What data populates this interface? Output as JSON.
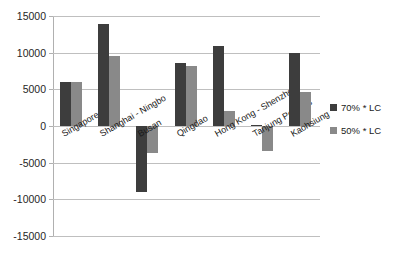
{
  "chart_data": {
    "type": "bar",
    "title": "",
    "subtitle": "",
    "xlabel": "",
    "ylabel": "",
    "ylim": [
      -15000,
      15000
    ],
    "ytick_values": [
      15000,
      10000,
      5000,
      0,
      -5000,
      -10000,
      -15000
    ],
    "ytick_labels": [
      "15000",
      "10000",
      "5000",
      "0",
      "-5000",
      "-10000",
      "-15000"
    ],
    "grid": true,
    "legend_position": "right",
    "categories": [
      "Singapore",
      "Shanghai - Ningbo",
      "Busan",
      "Qingdao",
      "Hong Kong - Shenzhen",
      "Tanjung Pelepas",
      "Kaohsiung"
    ],
    "series": [
      {
        "name": "70% * LC",
        "color": "#3d3d3d",
        "values": [
          6000,
          13900,
          -9000,
          8600,
          10900,
          100,
          9900
        ]
      },
      {
        "name": "50% * LC",
        "color": "#898989",
        "values": [
          5950,
          9600,
          -3700,
          8200,
          2100,
          -3450,
          4700
        ]
      }
    ]
  },
  "legend": {
    "items": [
      {
        "label": "70% * LC",
        "swatch": "series-70-swatch"
      },
      {
        "label": "50% * LC",
        "swatch": "series-50-swatch"
      }
    ]
  }
}
